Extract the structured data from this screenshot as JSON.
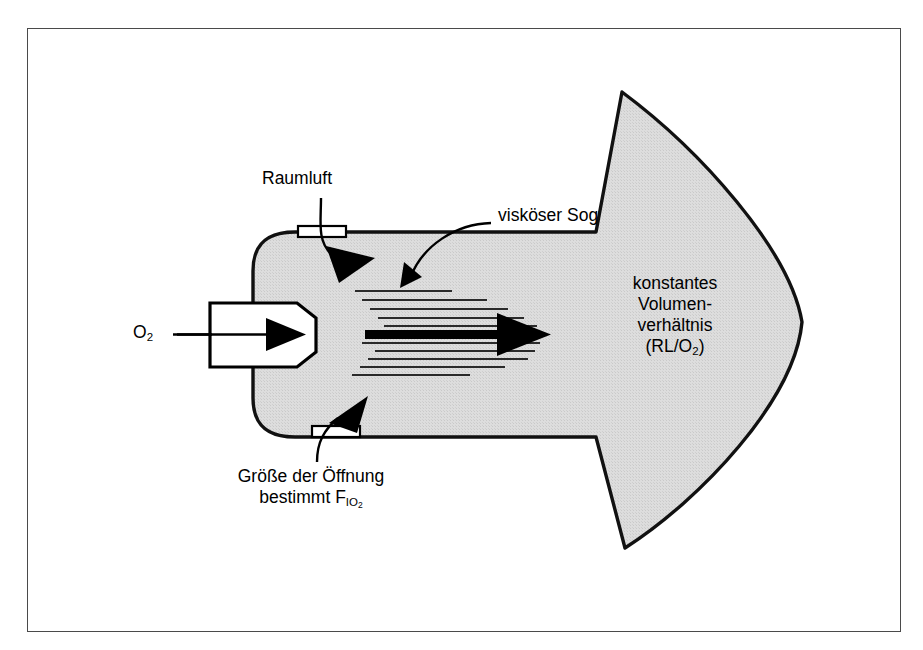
{
  "figure": {
    "language": "de",
    "background_color": "#ffffff",
    "frame_color": "#4a4a4a",
    "body_fill": "#dcdcdc",
    "outline_color": "#111111",
    "ink_color": "#000000"
  },
  "labels": {
    "oxygen_inlet": "O",
    "oxygen_inlet_sub": "2",
    "room_air": "Raumluft",
    "viscous_suction": "visköser Sog",
    "orifice_line1": "Größe der Öffnung",
    "orifice_line2_pre": "bestimmt F",
    "orifice_line2_sub": "IO",
    "orifice_line2_subsub": "2",
    "ratio_line1": "konstantes",
    "ratio_line2": "Volumen-",
    "ratio_line3": "verhältnis",
    "ratio_line4_pre": "(RL/O",
    "ratio_line4_sub": "2",
    "ratio_line4_post": ")"
  },
  "diagram_elements": {
    "body_shape": "venturi-mask-body",
    "jet_nozzle": "oxygen-jet-nozzle",
    "jet_arrow": "oxygen-jet-arrow",
    "main_flow_arrow": "mixed-gas-flow-arrow",
    "entrainment_lines_count": 13,
    "vents": [
      {
        "name": "upper-entrainment-port",
        "position": "top"
      },
      {
        "name": "lower-entrainment-port",
        "position": "bottom"
      }
    ],
    "arrows": [
      {
        "name": "room-air-inflow-arrow-top",
        "direction": "down-right"
      },
      {
        "name": "room-air-inflow-arrow-bottom",
        "direction": "up-right"
      },
      {
        "name": "viscous-suction-leader-arrow",
        "direction": "down-left"
      }
    ],
    "leader_lines": [
      {
        "name": "oxygen-leader-line"
      },
      {
        "name": "raumluft-leader-line"
      },
      {
        "name": "orifice-leader-line"
      },
      {
        "name": "viscous-suction-leader-line"
      }
    ]
  }
}
